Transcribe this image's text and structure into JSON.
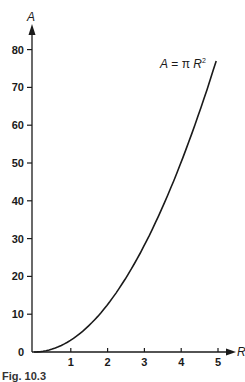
{
  "chart_data": {
    "type": "line",
    "title": "",
    "xlabel": "R",
    "ylabel": "A",
    "xlim": [
      0,
      5
    ],
    "ylim": [
      0,
      80
    ],
    "x_ticks": [
      1,
      2,
      3,
      4,
      5
    ],
    "y_ticks": [
      0,
      10,
      20,
      30,
      40,
      50,
      60,
      70,
      80
    ],
    "grid": false,
    "legend": null,
    "annotation": "A = π R²",
    "series": [
      {
        "name": "A = π R²",
        "x": [
          0,
          0.5,
          1,
          1.5,
          2,
          2.5,
          3,
          3.5,
          4,
          4.5,
          4.95
        ],
        "y": [
          0,
          0.79,
          3.14,
          7.07,
          12.57,
          19.63,
          28.27,
          38.48,
          50.27,
          63.62,
          76.98
        ]
      }
    ]
  },
  "labels": {
    "y_axis": "A",
    "x_axis": "R",
    "formula_A": "A",
    "formula_eq": " = π ",
    "formula_R": "R",
    "formula_exp": "2",
    "caption": "Fig. 10.3"
  },
  "colors": {
    "ink": "#1a1a1a",
    "background": "#ffffff"
  }
}
